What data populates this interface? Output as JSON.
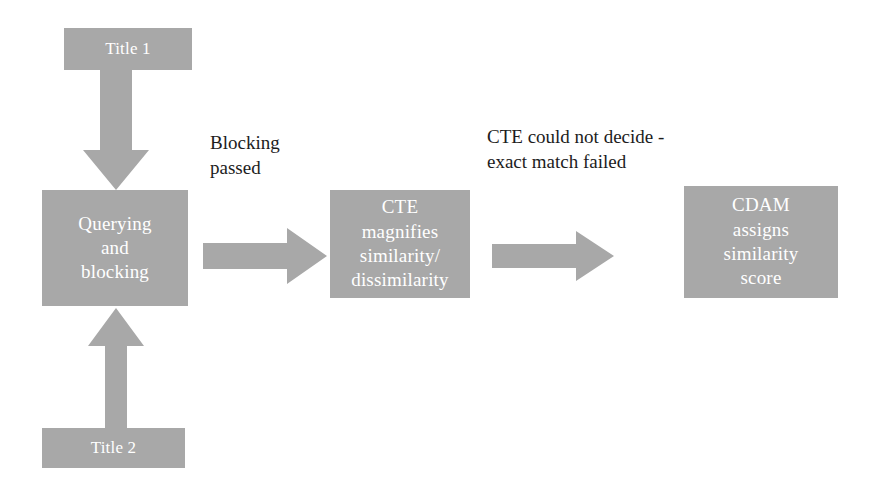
{
  "diagram": {
    "type": "flowchart",
    "colors": {
      "node_fill": "#a8a8a8",
      "node_text": "#ffffff",
      "arrow_fill": "#a8a8a8",
      "annotation_text": "#1c1c1c",
      "background": "#ffffff"
    },
    "nodes": [
      {
        "id": "title-1",
        "label": "Title 1",
        "shape": "rectangle"
      },
      {
        "id": "title-2",
        "label": "Title 2",
        "shape": "rectangle"
      },
      {
        "id": "querying",
        "label": "Querying\nand\nblocking",
        "shape": "rectangle"
      },
      {
        "id": "cte",
        "label": "CTE\nmagnifies\nsimilarity/\ndissimilarity",
        "shape": "rectangle"
      },
      {
        "id": "cdam",
        "label": "CDAM\nassigns\nsimilarity\nscore",
        "shape": "rectangle"
      }
    ],
    "arrows": [
      {
        "id": "arrow-down",
        "direction": "down",
        "from": "title-1",
        "to": "querying"
      },
      {
        "id": "arrow-up",
        "direction": "up",
        "from": "title-2",
        "to": "querying"
      },
      {
        "id": "arrow-right-1",
        "direction": "right",
        "from": "querying",
        "to": "cte",
        "label": "Blocking\npassed"
      },
      {
        "id": "arrow-right-2",
        "direction": "right",
        "from": "cte",
        "to": "cdam",
        "label": "CTE could not decide -\nexact match failed"
      }
    ],
    "annotations": [
      {
        "id": "blocking-passed",
        "text": "Blocking\npassed"
      },
      {
        "id": "cte-failed",
        "text": "CTE could not decide -\nexact match failed"
      }
    ]
  }
}
